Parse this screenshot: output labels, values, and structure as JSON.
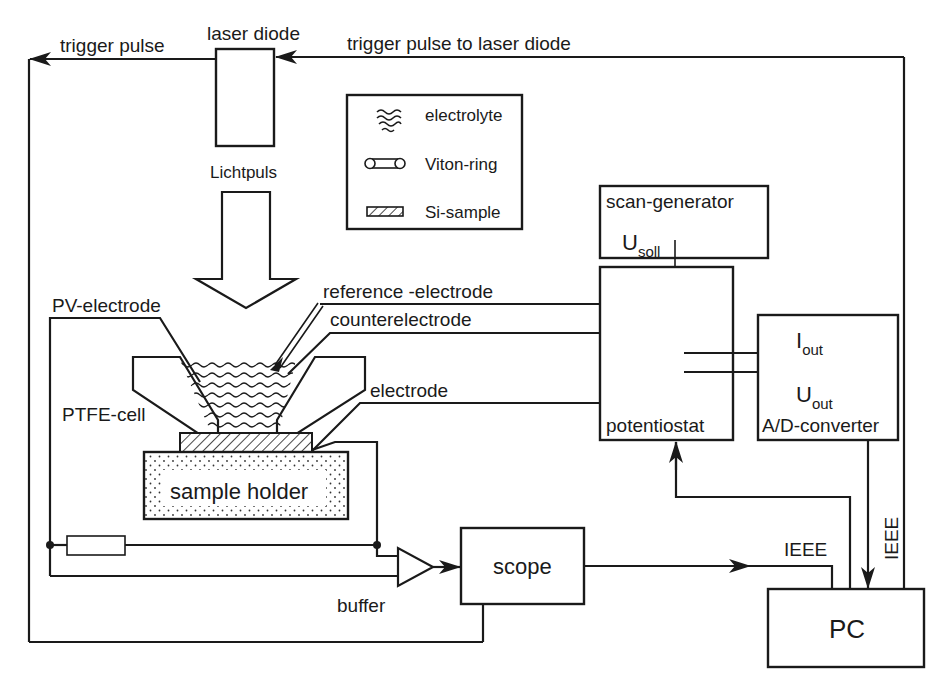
{
  "diagram": {
    "labels": {
      "trigger_pulse": "trigger pulse",
      "laser_diode": "laser diode",
      "trigger_pulse_to_laser": "trigger pulse to laser diode",
      "lichtpuls": "Lichtpuls",
      "pv_electrode": "PV-electrode",
      "reference_electrode": "reference -electrode",
      "counterelectrode": "counterelectrode",
      "electrode": "electrode",
      "ptfe_cell": "PTFE-cell",
      "sample_holder": "sample holder",
      "buffer": "buffer",
      "scope": "scope",
      "scan_generator": "scan-generator",
      "u_soll_main": "U",
      "u_soll_sub": "soll",
      "potentiostat": "potentiostat",
      "i_out_main": "I",
      "i_out_sub": "out",
      "u_out_main": "U",
      "u_out_sub": "out",
      "ad_converter": "A/D-converter",
      "ieee_horizontal": "IEEE",
      "ieee_vertical": "IEEE",
      "pc": "PC"
    },
    "legend": {
      "items": [
        {
          "icon": "electrolyte-wave-icon",
          "label": "electrolyte"
        },
        {
          "icon": "viton-ring-icon",
          "label": "Viton-ring"
        },
        {
          "icon": "si-sample-hatch-icon",
          "label": "Si-sample"
        }
      ]
    },
    "colors": {
      "line": "#1a1a1a",
      "background": "#ffffff"
    }
  }
}
